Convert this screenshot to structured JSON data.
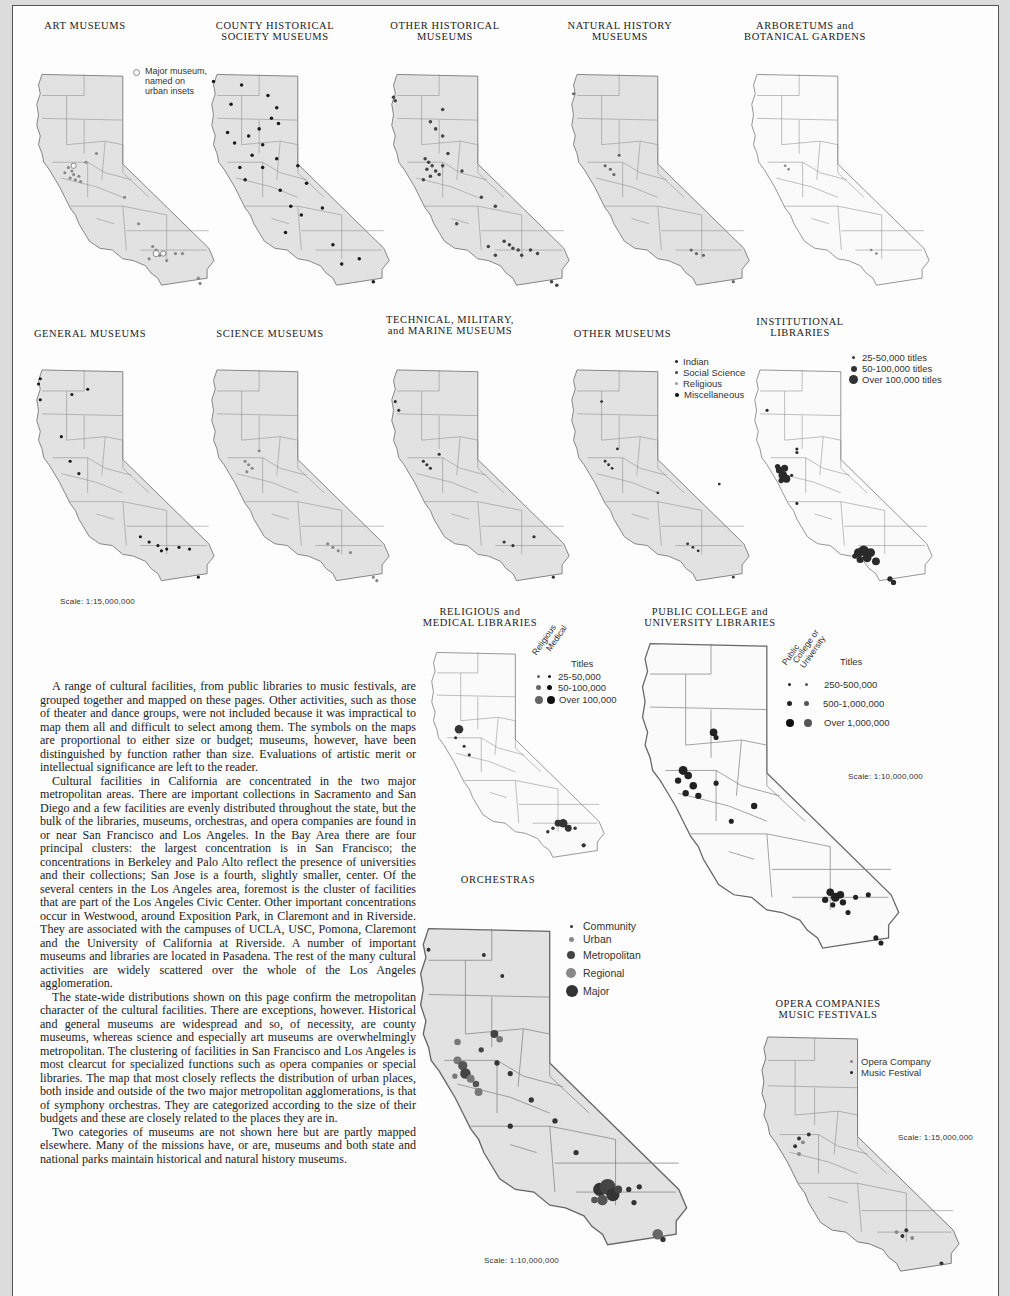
{
  "maps": {
    "art_museums": {
      "title": "ART MUSEUMS",
      "legend": [
        {
          "label": "Major museum,\nnamed on\nurban insets",
          "symbol": "hollow-circle"
        }
      ]
    },
    "county_historical": {
      "title": "COUNTY HISTORICAL\nSOCIETY MUSEUMS"
    },
    "other_historical": {
      "title": "OTHER HISTORICAL\nMUSEUMS"
    },
    "natural_history": {
      "title": "NATURAL HISTORY\nMUSEUMS"
    },
    "arboretums": {
      "title": "ARBORETUMS and\nBOTANICAL GARDENS"
    },
    "general_museums": {
      "title": "GENERAL MUSEUMS",
      "scale": "Scale: 1:15,000,000"
    },
    "science_museums": {
      "title": "SCIENCE MUSEUMS"
    },
    "technical_museums": {
      "title": "TECHNICAL, MILITARY,\nand MARINE MUSEUMS"
    },
    "other_museums": {
      "title": "OTHER MUSEUMS",
      "legend": [
        {
          "label": "Indian"
        },
        {
          "label": "Social Science"
        },
        {
          "label": "Religious"
        },
        {
          "label": "Miscellaneous"
        }
      ]
    },
    "institutional_libraries": {
      "title": "INSTITUTIONAL\nLIBRARIES",
      "legend": [
        {
          "label": "25-50,000 titles"
        },
        {
          "label": "50-100,000 titles"
        },
        {
          "label": "Over 100,000 titles"
        }
      ]
    },
    "religious_medical_libraries": {
      "title": "RELIGIOUS and\nMEDICAL LIBRARIES",
      "column_headers": [
        "Religious",
        "Medical"
      ],
      "legend_heading": "Titles",
      "legend": [
        {
          "label": "25-50,000"
        },
        {
          "label": "50-100,000"
        },
        {
          "label": "Over 100,000"
        }
      ]
    },
    "public_college_libraries": {
      "title": "PUBLIC COLLEGE and\nUNIVERSITY LIBRARIES",
      "column_headers": [
        "Public",
        "College or\nUniversity"
      ],
      "legend_heading": "Titles",
      "legend": [
        {
          "label": "250-500,000"
        },
        {
          "label": "500-1,000,000"
        },
        {
          "label": "Over 1,000,000"
        }
      ],
      "scale": "Scale: 1:10,000,000"
    },
    "orchestras": {
      "title": "ORCHESTRAS",
      "legend": [
        {
          "label": "Community"
        },
        {
          "label": "Urban"
        },
        {
          "label": "Metropolitan"
        },
        {
          "label": "Regional"
        },
        {
          "label": "Major"
        }
      ],
      "scale": "Scale: 1:10,000,000"
    },
    "opera_music": {
      "title": "OPERA COMPANIES\nMUSIC FESTIVALS",
      "legend": [
        {
          "label": "Opera Company"
        },
        {
          "label": "Music Festival"
        }
      ],
      "scale": "Scale: 1:15,000,000"
    }
  },
  "colors": {
    "page_bg": "#dcdcdc",
    "paper": "#fdfdfd",
    "map_fill_gray": "#e2e2e2",
    "map_fill_white": "#fafafa",
    "dot_black": "#1a1a1a",
    "dot_dark": "#3a3a3a",
    "dot_mid": "#6e6e6e",
    "dot_light": "#9a9a9a"
  },
  "body_text": {
    "paragraphs": [
      "A range of cultural facilities, from public libraries to music festivals, are grouped together and mapped on these pages. Other activities, such as those of theater and dance groups, were not included because it was impractical to map them all and difficult to select among them. The symbols on the maps are proportional to either size or budget; museums, however, have been distinguished by function rather than size. Evaluations of artistic merit or intellectual significance are left to the reader.",
      "Cultural facilities in California are concentrated in the two major metropolitan areas. There are important collections in Sacramento and San Diego and a few facilities are evenly distributed throughout the state, but the bulk of the libraries, museums, orchestras, and opera companies are found in or near San Francisco and Los Angeles. In the Bay Area there are four principal clusters: the largest concentration is in San Francisco; the concentrations in Berkeley and Palo Alto reflect the presence of universities and their collections; San Jose is a fourth, slightly smaller, center. Of the several centers in the Los Angeles area, foremost is the cluster of facilities that are part of the Los Angeles Civic Center. Other important concentrations occur in Westwood, around Exposition Park, in Claremont and in Riverside. They are associated with the campuses of UCLA, USC, Pomona, Claremont and the University of California at Riverside. A number of important museums and libraries are located in Pasadena. The rest of the many cultural activities are widely scattered over the whole of the Los Angeles agglomeration.",
      "The state-wide distributions shown on this page confirm the metropolitan character of the cultural facilities. There are exceptions, however. Historical and general museums are widespread and so, of necessity, are county museums, whereas science and especially art museums are overwhelmingly metropolitan. The clustering of facilities in San Francisco and Los Angeles is most clearcut for specialized functions such as opera companies or special libraries. The map that most closely reflects the distribution of urban places, both inside and outside of the two major metropolitan agglomerations, is that of symphony orchestras. They are categorized according to the size of their budgets and these are closely related to the places they are in.",
      "Two categories of museums are not shown here but are partly mapped elsewhere. Many of the missions have, or are, museums and both state and national parks maintain historical and natural history museums."
    ]
  }
}
